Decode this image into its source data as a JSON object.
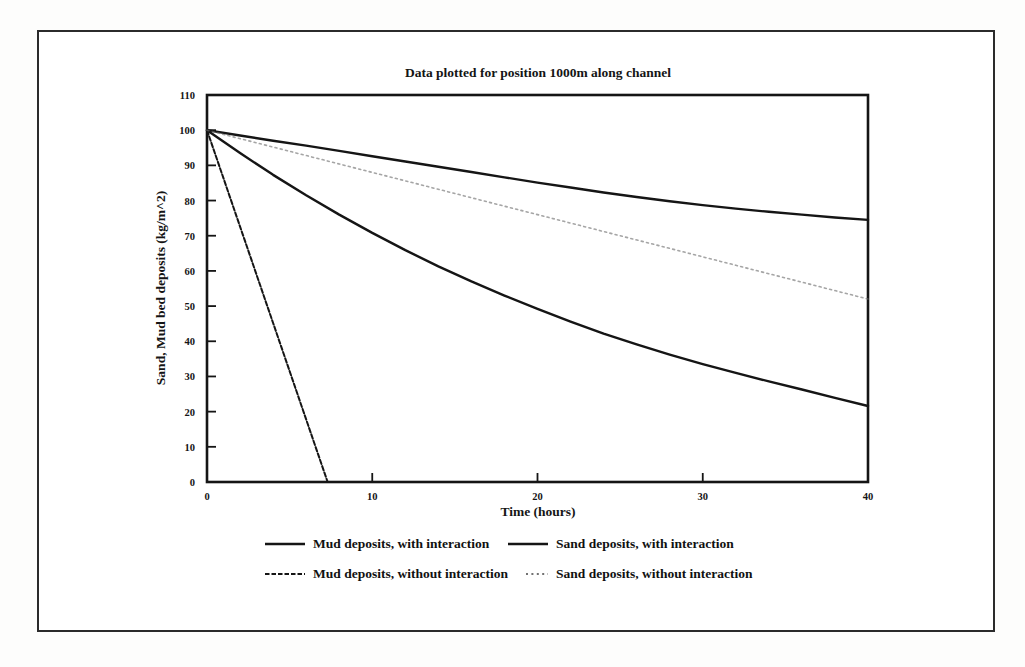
{
  "figure": {
    "background_color": "#ffffff",
    "border_color": "#2b2b2b",
    "ink_color": "#151515"
  },
  "chart_data": {
    "type": "line",
    "title": "Data plotted for position 1000m along channel",
    "xlabel": "Time (hours)",
    "ylabel": "Sand, Mud bed deposits (kg/m^2)",
    "xlim": [
      0,
      40
    ],
    "ylim": [
      0,
      110
    ],
    "xticks": [
      0,
      10,
      20,
      30,
      40
    ],
    "yticks": [
      0,
      10,
      20,
      30,
      40,
      50,
      60,
      70,
      80,
      90,
      100,
      110
    ],
    "xtick_labels": [
      "0",
      "10",
      "20",
      "30",
      "40"
    ],
    "ytick_labels": [
      "0",
      "10",
      "20",
      "30",
      "40",
      "50",
      "60",
      "70",
      "80",
      "90",
      "100",
      "110"
    ],
    "grid": false,
    "legend_position": "below-plot",
    "series": [
      {
        "name": "Mud deposits, with interaction",
        "style": "solid",
        "color": "#151515",
        "width": 2.4,
        "x": [
          0,
          2,
          4,
          6,
          8,
          10,
          12,
          14,
          16,
          18,
          20,
          22,
          24,
          26,
          28,
          30,
          32,
          34,
          36,
          38,
          40
        ],
        "values": [
          100,
          93.5,
          87.3,
          81.5,
          76.0,
          70.8,
          65.9,
          61.3,
          57.0,
          53.0,
          49.2,
          45.6,
          42.2,
          39.1,
          36.2,
          33.5,
          31.0,
          28.6,
          26.3,
          23.9,
          21.6
        ]
      },
      {
        "name": "Sand deposits, with interaction",
        "style": "solid",
        "color": "#151515",
        "width": 2.4,
        "x": [
          0,
          2,
          4,
          6,
          8,
          10,
          12,
          14,
          16,
          18,
          20,
          22,
          24,
          26,
          28,
          30,
          32,
          34,
          36,
          38,
          40
        ],
        "values": [
          100,
          98.5,
          97.0,
          95.6,
          94.1,
          92.6,
          91.1,
          89.6,
          88.1,
          86.6,
          85.1,
          83.7,
          82.3,
          81.0,
          79.8,
          78.7,
          77.7,
          76.8,
          76.0,
          75.2,
          74.5
        ]
      },
      {
        "name": "Mud deposits, without interaction",
        "style": "dotted",
        "color": "#151515",
        "width": 2.0,
        "x": [
          0,
          1,
          2,
          3,
          4,
          5,
          6,
          7,
          7.3
        ],
        "values": [
          100,
          86.3,
          72.6,
          58.9,
          45.2,
          31.5,
          17.8,
          4.1,
          0
        ]
      },
      {
        "name": "Sand deposits, without interaction",
        "style": "faint-dotted",
        "color": "#6e6e6e",
        "width": 1.6,
        "x": [
          0,
          4,
          8,
          12,
          16,
          20,
          24,
          28,
          32,
          36,
          40
        ],
        "values": [
          100,
          95.2,
          90.4,
          85.6,
          80.8,
          76.0,
          71.2,
          66.4,
          61.6,
          56.8,
          52.0
        ]
      }
    ],
    "legend": [
      {
        "label": "Mud deposits, with interaction",
        "style": "solid"
      },
      {
        "label": "Sand deposits, with interaction",
        "style": "solid"
      },
      {
        "label": "Mud deposits, without interaction",
        "style": "dotted"
      },
      {
        "label": "Sand deposits, without interaction",
        "style": "faint-dotted"
      }
    ]
  }
}
